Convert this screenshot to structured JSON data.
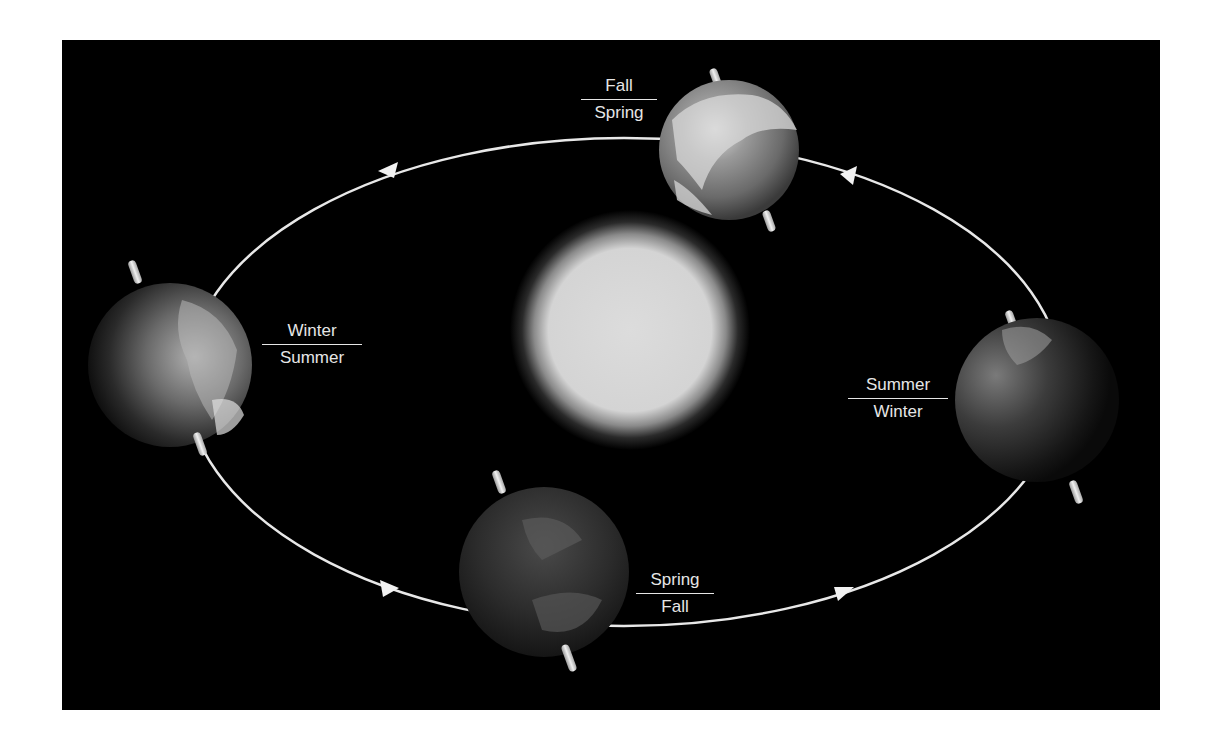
{
  "diagram": {
    "colors": {
      "background": "#000000",
      "frame_outside": "#ffffff",
      "orbit_line": "#e8e8e8",
      "label_text": "#e6e6e6",
      "sun": "#d9d9d9"
    },
    "center": {
      "name": "Sun"
    },
    "orbit": {
      "shape": "ellipse",
      "direction": "counterclockwise",
      "arrow_count": 4
    },
    "positions": [
      {
        "id": "top",
        "top_label": "Fall",
        "bottom_label": "Spring",
        "earth_lighting": "bright"
      },
      {
        "id": "left",
        "top_label": "Winter",
        "bottom_label": "Summer",
        "earth_lighting": "half-lit"
      },
      {
        "id": "bottom",
        "top_label": "Spring",
        "bottom_label": "Fall",
        "earth_lighting": "dark"
      },
      {
        "id": "right",
        "top_label": "Summer",
        "bottom_label": "Winter",
        "earth_lighting": "dim"
      }
    ]
  }
}
